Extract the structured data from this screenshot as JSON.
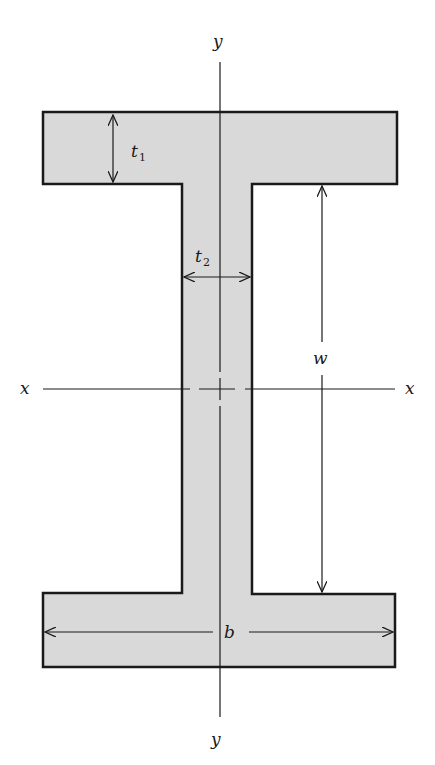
{
  "diagram": {
    "type": "I-beam cross-section",
    "colors": {
      "fill": "#d9d9d9",
      "stroke": "#1a1a1a",
      "background": "#ffffff"
    },
    "labels": {
      "y_top": "y",
      "y_bottom": "y",
      "x_left": "x",
      "x_right": "x",
      "t1_main": "t",
      "t1_sub": "1",
      "t2_main": "t",
      "t2_sub": "2",
      "w": "w",
      "b": "b"
    },
    "dimensions": [
      {
        "name": "t1",
        "description": "flange thickness"
      },
      {
        "name": "t2",
        "description": "web thickness"
      },
      {
        "name": "w",
        "description": "web height between flanges"
      },
      {
        "name": "b",
        "description": "flange width"
      }
    ],
    "axes": [
      {
        "name": "x",
        "orientation": "horizontal",
        "centroidal": true
      },
      {
        "name": "y",
        "orientation": "vertical",
        "centroidal": true
      }
    ]
  }
}
